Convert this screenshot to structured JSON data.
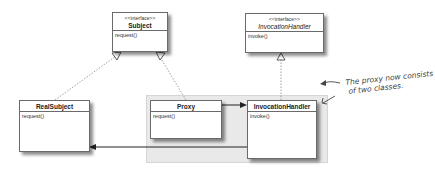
{
  "diagram": {
    "type": "UML class diagram (dynamic proxy)",
    "classes": [
      {
        "id": "subject",
        "stereotype": "<<interface>>",
        "name": "Subject",
        "methods": [
          "request()"
        ],
        "italic_name": false
      },
      {
        "id": "invocation_handler_interface",
        "stereotype": "<<interface>>",
        "name": "InvocationHandler",
        "methods": [
          "invoke()"
        ],
        "italic_name": true
      },
      {
        "id": "real_subject",
        "stereotype": "",
        "name": "RealSubject",
        "methods": [
          "request()"
        ],
        "italic_name": false
      },
      {
        "id": "proxy",
        "stereotype": "",
        "name": "Proxy",
        "methods": [
          "request()"
        ],
        "italic_name": false
      },
      {
        "id": "invocation_handler",
        "stereotype": "",
        "name": "InvocationHandler",
        "methods": [
          "invoke()"
        ],
        "italic_name": false
      }
    ],
    "relationships": [
      {
        "from": "real_subject",
        "to": "subject",
        "kind": "realization"
      },
      {
        "from": "proxy",
        "to": "subject",
        "kind": "realization"
      },
      {
        "from": "invocation_handler",
        "to": "invocation_handler_interface",
        "kind": "realization"
      },
      {
        "from": "proxy",
        "to": "invocation_handler",
        "kind": "association"
      },
      {
        "from": "invocation_handler",
        "to": "real_subject",
        "kind": "association"
      }
    ],
    "annotation": {
      "line1": "The proxy now consists",
      "line2": "of two classes."
    },
    "colors": {
      "shade": "#e9e9e9",
      "border": "#6a6a6a",
      "line": "#333333",
      "dotted": "#888888"
    }
  }
}
